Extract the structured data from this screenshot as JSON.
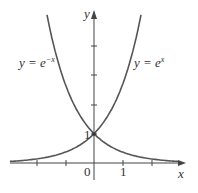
{
  "chart_data": {
    "type": "line",
    "title": "",
    "xlabel": "x",
    "ylabel": "y",
    "xlim": [
      -2.9,
      2.9
    ],
    "ylim": [
      0,
      5.1
    ],
    "grid": false,
    "x_tick_labels": {
      "0": "0",
      "1": "1"
    },
    "y_tick_labels": {
      "1": "1"
    },
    "x_ticks": [
      -2,
      -1,
      0,
      1,
      2
    ],
    "y_ticks": [
      1,
      2,
      3,
      4
    ],
    "series": [
      {
        "name": "y = e^x",
        "label": "y = e",
        "exponent": "x",
        "function": "exp(x)",
        "x": [
          -2.9,
          -2,
          -1,
          0,
          1,
          1.62
        ],
        "values": [
          0.055,
          0.135,
          0.368,
          1,
          2.718,
          5.05
        ]
      },
      {
        "name": "y = e^-x",
        "label": "y = e",
        "exponent": "−x",
        "function": "exp(-x)",
        "x": [
          -1.62,
          -1,
          0,
          1,
          2,
          2.9
        ],
        "values": [
          5.05,
          2.718,
          1,
          0.368,
          0.135,
          0.055
        ]
      }
    ],
    "annotations": [
      "y = e^-x",
      "y = e^x"
    ],
    "intersection": {
      "x": 0,
      "y": 1
    }
  },
  "labels": {
    "x_axis": "x",
    "y_axis": "y",
    "origin": "0",
    "x_one": "1",
    "y_one": "1",
    "left_curve_prefix": "y = e",
    "left_curve_exp": "−x",
    "right_curve_prefix": "y = e",
    "right_curve_exp": "x"
  },
  "colors": {
    "curve": "#555555",
    "axis": "#444444"
  }
}
